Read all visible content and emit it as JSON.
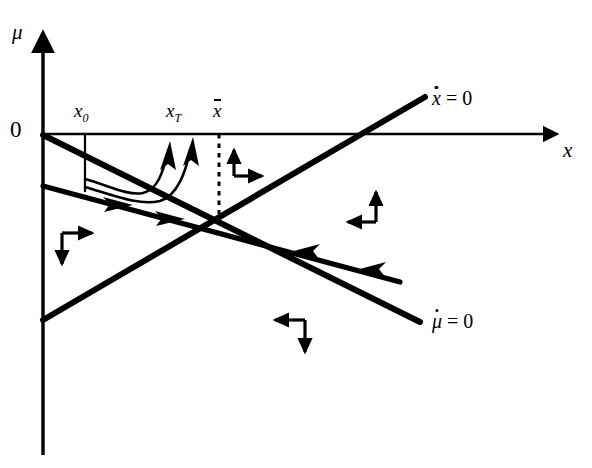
{
  "figure": {
    "type": "phase-diagram",
    "background_color": "#ffffff",
    "ink_color": "#000000",
    "width": 592,
    "height": 468
  },
  "axes": {
    "vertical": {
      "name": "mu",
      "label": "μ",
      "origin_label": "0",
      "x_px": 43,
      "top_px": 30,
      "bottom_px": 455
    },
    "horizontal": {
      "name": "x",
      "label": "x",
      "y_px": 134,
      "left_px": 43,
      "right_px": 560
    }
  },
  "tick_labels": [
    {
      "id": "x0",
      "base": "x",
      "sub": "0",
      "overline": false,
      "x_px": 85,
      "y_px": 112
    },
    {
      "id": "xT",
      "base": "x",
      "sub": "T",
      "overline": false,
      "x_px": 178,
      "y_px": 112
    },
    {
      "id": "xbar",
      "base": "x",
      "sub": "",
      "overline": true,
      "x_px": 222,
      "y_px": 112
    }
  ],
  "curves": [
    {
      "id": "xdot-zero",
      "label": "ẋ = 0",
      "label_base": "x",
      "label_dot": true,
      "label_rhs": "= 0",
      "label_x_px": 432,
      "label_y_px": 90,
      "description": "upward sloping locus from lower-left to upper-right",
      "from": [
        43,
        320
      ],
      "to": [
        425,
        97
      ]
    },
    {
      "id": "mudot-zero",
      "label": "μ̇ = 0",
      "label_base": "μ",
      "label_dot": true,
      "label_rhs": "= 0",
      "label_x_px": 432,
      "label_y_px": 313,
      "description": "downward sloping locus from origin to lower-right",
      "from": [
        43,
        135
      ],
      "to": [
        420,
        322
      ]
    },
    {
      "id": "saddle-path",
      "description": "stable arm with double arrowheads running down-right toward the steady state and continuing",
      "from": [
        43,
        186
      ],
      "to": [
        400,
        282
      ]
    }
  ],
  "steady_state": {
    "label": "intersection",
    "x_px": 219,
    "y_px": 214,
    "dotted_guide": {
      "from": [
        219,
        134
      ],
      "to": [
        219,
        214
      ]
    }
  },
  "tick_marks": [
    {
      "id": "x0-drop",
      "from": [
        85,
        134
      ],
      "to": [
        85,
        192
      ]
    }
  ],
  "trajectories": [
    {
      "id": "traj-from-x0",
      "description": "curve from x0 dipping down then rising to the x-axis with arrowhead"
    },
    {
      "id": "traj-to-xT",
      "description": "second curve rising to the x-axis near xT with arrowhead"
    }
  ],
  "direction_arrows": [
    {
      "id": "quadrant-upper-middle",
      "horizontal": "right",
      "vertical": "up",
      "x_px": 232,
      "y_px": 142
    },
    {
      "id": "quadrant-left",
      "horizontal": "right",
      "vertical": "down",
      "x_px": 58,
      "y_px": 231
    },
    {
      "id": "quadrant-right",
      "horizontal": "left",
      "vertical": "up",
      "x_px": 362,
      "y_px": 188
    },
    {
      "id": "quadrant-bottom",
      "horizontal": "left",
      "vertical": "down",
      "x_px": 272,
      "y_px": 318
    }
  ],
  "flow_arrowheads": [
    {
      "id": "saddle-arrow-1",
      "x_px": 120,
      "y_px": 199,
      "direction": "down-right"
    },
    {
      "id": "saddle-arrow-2",
      "x_px": 172,
      "y_px": 213,
      "direction": "down-right"
    },
    {
      "id": "saddle-arrow-3",
      "x_px": 305,
      "y_px": 248,
      "direction": "up-left"
    },
    {
      "id": "saddle-arrow-4",
      "x_px": 370,
      "y_px": 266,
      "direction": "up-left"
    }
  ]
}
